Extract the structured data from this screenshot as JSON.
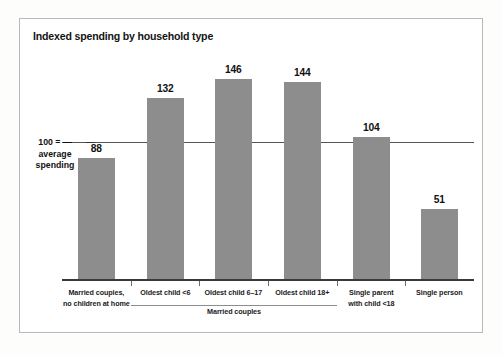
{
  "chart_data": {
    "type": "bar",
    "title": "Indexed spending by household type",
    "xlabel": "",
    "ylabel": "",
    "categories": [
      "Married couples, no children at home",
      "Oldest child <6",
      "Oldest child 6–17",
      "Oldest child 18+",
      "Single parent with child <18",
      "Single person"
    ],
    "category_lines": [
      [
        "Married couples,",
        "no children at home"
      ],
      [
        "Oldest child <6"
      ],
      [
        "Oldest child 6–17"
      ],
      [
        "Oldest child 18+"
      ],
      [
        "Single parent",
        "with child <18"
      ],
      [
        "Single person"
      ]
    ],
    "values": [
      88,
      132,
      146,
      144,
      104,
      51
    ],
    "value_labels": [
      "88",
      "132",
      "146",
      "144",
      "104",
      "51"
    ],
    "ylim": [
      0,
      160
    ],
    "grid": false,
    "legend": "none",
    "reference_line": {
      "value": 100,
      "label_lines": [
        "100 = —",
        "average",
        "spending"
      ]
    },
    "group_annotation": {
      "label": "Married couples",
      "spans_categories": [
        "Oldest child <6",
        "Oldest child 6–17",
        "Oldest child 18+"
      ]
    },
    "colors": {
      "bar": "#8d8d8d",
      "baseline": "#3a3a3a",
      "reference_line": "#555555",
      "text": "#111111",
      "frame": "#b9b9b9",
      "background": "#ffffff"
    }
  }
}
